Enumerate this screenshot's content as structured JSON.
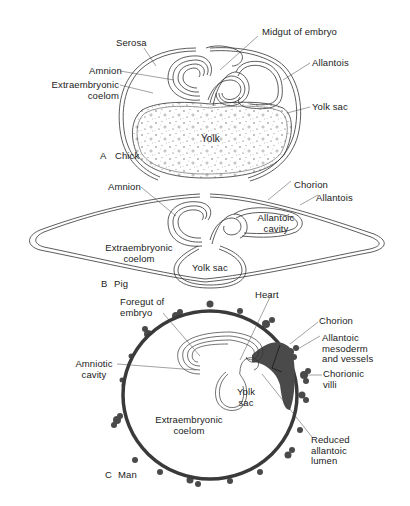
{
  "figure": {
    "colors": {
      "background": "#ffffff",
      "line": "#333333",
      "chorion_dark": "#4a4a4a",
      "yolk_speckle": "#666666"
    },
    "panels": [
      {
        "id": "A",
        "letter": "A",
        "name": "Chick",
        "labels": {
          "serosa": "Serosa",
          "amnion": "Amnion",
          "extraembryonic_coelom": "Extraembryonic\ncoelom",
          "midgut": "Midgut of embryo",
          "allantois": "Allantois",
          "yolk_sac": "Yolk sac",
          "yolk": "Yolk"
        }
      },
      {
        "id": "B",
        "letter": "B",
        "name": "Pig",
        "labels": {
          "amnion": "Amnion",
          "chorion": "Chorion",
          "allantois": "Allantois",
          "allantoic_cavity": "Allantoic\ncavity",
          "extraembryonic_coelom": "Extraembryonic\ncoelom",
          "yolk_sac": "Yolk sac"
        }
      },
      {
        "id": "C",
        "letter": "C",
        "name": "Man",
        "labels": {
          "foregut": "Foregut of\nembryo",
          "heart": "Heart",
          "amniotic_cavity": "Amniotic\ncavity",
          "chorion": "Chorion",
          "allantoic_mesoderm": "Allantoic\nmesoderm\nand vessels",
          "chorionic_villi": "Chorionic\nvilli",
          "yolk_sac": "Yolk\nsac",
          "extraembryonic_coelom": "Extraembryonic\ncoelom",
          "reduced_allantoic_lumen": "Reduced\nallantoic\nlumen"
        }
      }
    ]
  }
}
